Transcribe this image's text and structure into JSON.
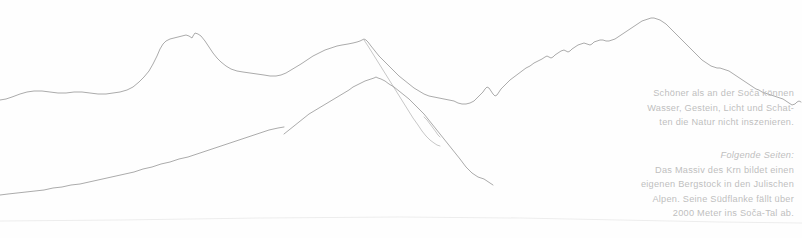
{
  "page": {
    "background_color": "#fefefe",
    "width": 802,
    "height": 238
  },
  "artwork": {
    "name": "mountain-panorama-line-drawing",
    "stroke_color": "#9c9c9c",
    "description": "Thin hand-drawn contour line panorama of a mountain skyline with a foreground ridge"
  },
  "captions": {
    "primary": {
      "lines": [
        "Schöner als an der Soča können",
        "Wasser, Gestein, Licht und Schat-",
        "ten die Natur nicht inszenieren."
      ]
    },
    "secondary": {
      "heading": "Folgende Seiten:",
      "lines": [
        "Das Massiv des Krn bildet einen",
        "eigenen Bergstock in den Julischen",
        "Alpen. Seine Südflanke fällt über",
        "2000 Meter ins Soča-Tal ab."
      ]
    },
    "text_color": "#bfbfbf"
  }
}
